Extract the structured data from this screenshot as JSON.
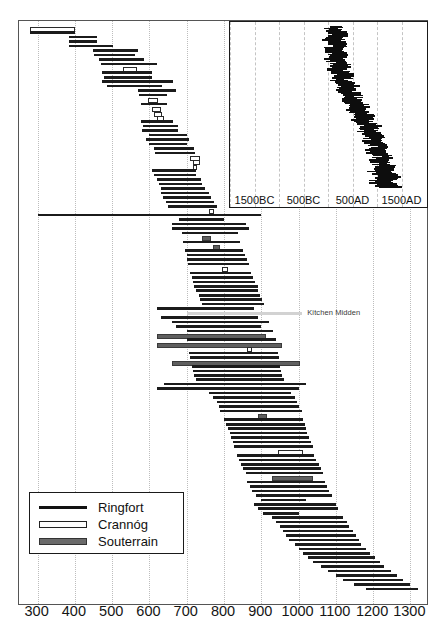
{
  "chart_data": {
    "type": "bar",
    "chart_style": "horizontal-range-bars",
    "title": "",
    "xlabel": "",
    "ylabel": "",
    "xlim": [
      250,
      1350
    ],
    "grid": true,
    "tick_labels": [
      "300",
      "400",
      "500",
      "600",
      "700",
      "800",
      "900",
      "1000",
      "1100",
      "1200",
      "1300"
    ],
    "tick_values": [
      300,
      400,
      500,
      600,
      700,
      800,
      900,
      1000,
      1100,
      1200,
      1300
    ],
    "legend": {
      "position": "bottom-left",
      "entries": [
        {
          "label": "Ringfort",
          "style": "thin-black-line",
          "color": "#111111"
        },
        {
          "label": "Crannóg",
          "style": "hollow-outlined-bar",
          "color": "#ffffff"
        },
        {
          "label": "Souterrain",
          "style": "thick-grey-bar",
          "color": "#6a6a6a"
        }
      ]
    },
    "annotations": [
      {
        "text": "Kitchen Midden",
        "type": "midden",
        "start": 700,
        "end": 1010,
        "row": 64
      }
    ],
    "series": [
      {
        "name": "Ringfort",
        "color": "#1b1b1b",
        "ranges": [
          [
            279,
            400
          ],
          [
            383,
            459
          ],
          [
            383,
            459
          ],
          [
            383,
            502
          ],
          [
            448,
            570
          ],
          [
            452,
            560
          ],
          [
            465,
            585
          ],
          [
            470,
            619
          ],
          [
            473,
            608
          ],
          [
            477,
            608
          ],
          [
            474,
            662
          ],
          [
            487,
            633
          ],
          [
            568,
            672
          ],
          [
            572,
            648
          ],
          [
            576,
            648
          ],
          [
            576,
            662
          ],
          [
            582,
            677
          ],
          [
            580,
            677
          ],
          [
            600,
            700
          ],
          [
            592,
            706
          ],
          [
            600,
            702
          ],
          [
            612,
            720
          ],
          [
            615,
            722
          ],
          [
            606,
            724
          ],
          [
            612,
            724
          ],
          [
            620,
            738
          ],
          [
            626,
            742
          ],
          [
            630,
            748
          ],
          [
            630,
            760
          ],
          [
            636,
            764
          ],
          [
            644,
            774
          ],
          [
            650,
            782
          ],
          [
            300,
            900
          ],
          [
            680,
            800
          ],
          [
            660,
            860
          ],
          [
            660,
            866
          ],
          [
            686,
            838
          ],
          [
            690,
            844
          ],
          [
            696,
            850
          ],
          [
            700,
            856
          ],
          [
            700,
            862
          ],
          [
            704,
            868
          ],
          [
            710,
            872
          ],
          [
            714,
            878
          ],
          [
            718,
            884
          ],
          [
            720,
            890
          ],
          [
            726,
            892
          ],
          [
            732,
            896
          ],
          [
            736,
            902
          ],
          [
            740,
            908
          ],
          [
            620,
            880
          ],
          [
            630,
            890
          ],
          [
            660,
            920
          ],
          [
            670,
            900
          ],
          [
            700,
            932
          ],
          [
            700,
            940
          ],
          [
            706,
            946
          ],
          [
            710,
            948
          ],
          [
            714,
            950
          ],
          [
            716,
            952
          ],
          [
            720,
            956
          ],
          [
            726,
            960
          ],
          [
            640,
            1020
          ],
          [
            620,
            1000
          ],
          [
            760,
            980
          ],
          [
            770,
            990
          ],
          [
            780,
            996
          ],
          [
            786,
            1000
          ],
          [
            790,
            1008
          ],
          [
            800,
            1012
          ],
          [
            806,
            1016
          ],
          [
            812,
            1020
          ],
          [
            816,
            1024
          ],
          [
            820,
            1028
          ],
          [
            824,
            1034
          ],
          [
            828,
            1038
          ],
          [
            834,
            1042
          ],
          [
            840,
            1048
          ],
          [
            846,
            1054
          ],
          [
            850,
            1060
          ],
          [
            858,
            1066
          ],
          [
            862,
            1070
          ],
          [
            870,
            1076
          ],
          [
            876,
            1082
          ],
          [
            886,
            1090
          ],
          [
            900,
            1020
          ],
          [
            880,
            1100
          ],
          [
            890,
            1106
          ],
          [
            904,
            1000
          ],
          [
            930,
            1120
          ],
          [
            940,
            1130
          ],
          [
            950,
            1136
          ],
          [
            958,
            1146
          ],
          [
            966,
            1154
          ],
          [
            974,
            1162
          ],
          [
            990,
            1168
          ],
          [
            1000,
            1180
          ],
          [
            1012,
            1192
          ],
          [
            1026,
            1206
          ],
          [
            1040,
            1218
          ],
          [
            1060,
            1230
          ],
          [
            1080,
            1248
          ],
          [
            1100,
            1264
          ],
          [
            1120,
            1280
          ],
          [
            1150,
            1300
          ],
          [
            1180,
            1320
          ]
        ]
      },
      {
        "name": "Crannóg",
        "color": "#ffffff",
        "ranges": [
          [
            279,
            400
          ],
          [
            530,
            566
          ],
          [
            596,
            624
          ],
          [
            606,
            632
          ],
          [
            612,
            634
          ],
          [
            620,
            640
          ],
          [
            708,
            736
          ],
          [
            716,
            736
          ],
          [
            718,
            728
          ],
          [
            760,
            774
          ],
          [
            795,
            810
          ],
          [
            862,
            874
          ],
          [
            944,
            1012
          ]
        ]
      },
      {
        "name": "Souterrain",
        "color": "#6a6a6a",
        "ranges": [
          [
            620,
            912
          ],
          [
            620,
            955
          ],
          [
            660,
            1005
          ],
          [
            742,
            766
          ],
          [
            770,
            790
          ],
          [
            890,
            916
          ],
          [
            930,
            1040
          ]
        ]
      }
    ],
    "inset": {
      "type": "bar",
      "chart_style": "horizontal-range-bars",
      "xlim": [
        -2000,
        2000
      ],
      "tick_labels": [
        "1500BC",
        "500BC",
        "500AD",
        "1500AD"
      ],
      "tick_values": [
        -1500,
        -500,
        500,
        1500
      ],
      "grid": true,
      "description": "Dense S-shaped cluster of all site date-ranges from 1500BC to 1500AD",
      "bar_count": 180
    }
  }
}
